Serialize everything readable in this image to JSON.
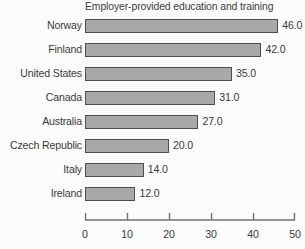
{
  "chart_data": {
    "type": "bar",
    "orientation": "horizontal",
    "title": "Employer-provided education and training",
    "xlabel": "",
    "ylabel": "",
    "categories": [
      "Norway",
      "Finland",
      "United States",
      "Canada",
      "Australia",
      "Czech Republic",
      "Italy",
      "Ireland"
    ],
    "values": [
      46.0,
      42.0,
      35.0,
      31.0,
      27.0,
      20.0,
      14.0,
      12.0
    ],
    "value_labels": [
      "46.0",
      "42.0",
      "35.0",
      "31.0",
      "27.0",
      "20.0",
      "14.0",
      "12.0"
    ],
    "xlim": [
      0,
      50
    ],
    "xticks": [
      0,
      10,
      20,
      30,
      40,
      50
    ],
    "xtick_labels": [
      "0",
      "10",
      "20",
      "30",
      "40",
      "50"
    ],
    "grid": false,
    "legend": false,
    "bar_color": "#a9a9a9",
    "bar_border_color": "#4e4e4e",
    "text_color": "#3a3a3a",
    "background_color": "#fcfcfc"
  }
}
